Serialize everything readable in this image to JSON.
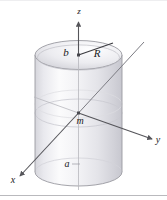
{
  "figure": {
    "kind": "3d-cylinder-coordinate-diagram",
    "background_color": "#ffffff",
    "border": {
      "bottom_rule_color": "#b9b9bd",
      "top_rule_color": "#e6e6e8"
    },
    "axes": [
      {
        "id": "z",
        "label": "z",
        "direction": "up",
        "color": "#555558"
      },
      {
        "id": "y",
        "label": "y",
        "direction": "right-down",
        "color": "#555558"
      },
      {
        "id": "x",
        "label": "x",
        "direction": "left-down",
        "color": "#555558"
      }
    ],
    "labels": [
      {
        "id": "b",
        "text": "b",
        "meaning": "top-half-height"
      },
      {
        "id": "R",
        "text": "R",
        "meaning": "cylinder-radius"
      },
      {
        "id": "m",
        "text": "m",
        "meaning": "point-mass-at-origin"
      },
      {
        "id": "a",
        "text": "a",
        "meaning": "bottom-half-height"
      }
    ],
    "colors": {
      "cylinder_outline": "#9a9aa0",
      "cylinder_fill_light": "#fafafb",
      "cylinder_fill_mid": "#ededf0",
      "cylinder_fill_dark": "#d8d8dd",
      "top_cap_fill_light": "#fdfdfe",
      "top_cap_fill_dark": "#cfcfd5",
      "hidden_edge": "#c3c3c9",
      "axis_line": "#55555a",
      "radius_line": "#3a3a3f",
      "text": "#1a1a1a"
    }
  }
}
